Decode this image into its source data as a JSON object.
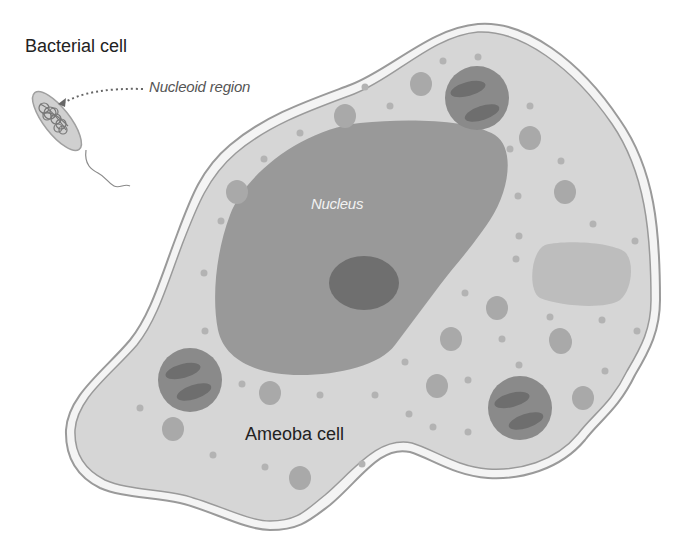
{
  "labels": {
    "bacterial_cell": "Bacterial cell",
    "nucleoid_region": "Nucleoid region",
    "nucleus": "Nucleus",
    "ameoba_cell": "Ameoba cell"
  },
  "colors": {
    "membrane_outline": "#9a9a9a",
    "membrane_gap": "#f4f4f4",
    "cytoplasm": "#d6d6d6",
    "nucleus": "#999999",
    "nucleolus": "#6f6f6f",
    "vacuole": "#a9a9a9",
    "mitochondrion_body": "#8a8a8a",
    "mitochondrion_cristae": "#6e6e6e",
    "food_vacuole": "#bdbdbd",
    "granule": "#b3b3b3",
    "bacterium_fill": "#d0d0d0",
    "nucleoid_strand": "#777777"
  }
}
